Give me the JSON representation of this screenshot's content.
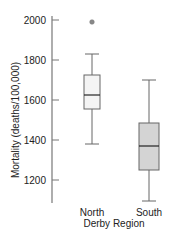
{
  "chart_data": {
    "type": "box",
    "title": "",
    "xlabel": "Derby Region",
    "ylabel": "Mortality (deaths/100,000)",
    "ylim": [
      1080,
      2020
    ],
    "yticks": [
      2000,
      1800,
      1600,
      1400,
      1200
    ],
    "ytick_labels": [
      "2000",
      "1800",
      "1600",
      "1400",
      "1200"
    ],
    "grid": false,
    "legend": null,
    "categories": [
      "North",
      "South"
    ],
    "series": [
      {
        "name": "North",
        "whisker_low": 1380,
        "q1": 1555,
        "median": 1625,
        "q3": 1725,
        "whisker_high": 1830,
        "outliers": [
          1990
        ],
        "fill": "#f4f4f4"
      },
      {
        "name": "South",
        "whisker_low": 1095,
        "q1": 1250,
        "median": 1370,
        "q3": 1485,
        "whisker_high": 1700,
        "outliers": [],
        "fill": "#d4d4d4"
      }
    ]
  },
  "colors": {
    "axis": "#777777",
    "box_stroke": "#666666",
    "median": "#222222",
    "outlier": "#888888"
  }
}
